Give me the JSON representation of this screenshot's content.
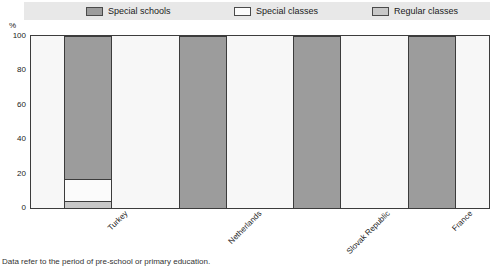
{
  "chart_data": {
    "type": "bar",
    "subtype": "stacked-bar-100",
    "title": "",
    "xlabel": "",
    "ylabel": "%",
    "ylim": [
      0,
      100
    ],
    "yticks": [
      0,
      20,
      40,
      60,
      80,
      100
    ],
    "grid": false,
    "legend_position": "top",
    "categories": [
      "Turkey",
      "Netherlands",
      "Slovak Republic",
      "France"
    ],
    "series": [
      {
        "name": "Special schools",
        "color": "#9c9c9c",
        "values": [
          83,
          100,
          100,
          100
        ]
      },
      {
        "name": "Special classes",
        "color": "#fbfbfb",
        "values": [
          13,
          0,
          0,
          0
        ]
      },
      {
        "name": "Regular classes",
        "color": "#c8c8c8",
        "values": [
          4,
          0,
          0,
          0
        ]
      }
    ],
    "stack_order_bottom_to_top": [
      "Regular classes",
      "Special classes",
      "Special schools"
    ]
  },
  "legend": {
    "items": [
      {
        "label": "Special schools",
        "color": "#9c9c9c"
      },
      {
        "label": "Special classes",
        "color": "#fbfbfb"
      },
      {
        "label": "Regular classes",
        "color": "#c8c8c8"
      }
    ]
  },
  "axis": {
    "unit": "%",
    "ticks": [
      "100",
      "80",
      "60",
      "40",
      "20",
      "0"
    ]
  },
  "footnote": {
    "text": "Data refer to the period of pre-school or primary education."
  }
}
